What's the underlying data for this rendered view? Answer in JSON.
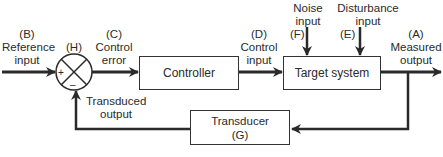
{
  "diagram": {
    "type": "feedback-control-loop",
    "blocks": {
      "controller": {
        "label": "Controller"
      },
      "target_system": {
        "label": "Target system"
      },
      "transducer": {
        "label": "Transducer",
        "tag": "(G)"
      }
    },
    "summing_junction": {
      "tag": "(H)",
      "plus": "+",
      "minus": "–"
    },
    "signals": {
      "reference_input": {
        "tag": "(B)",
        "line1": "Reference",
        "line2": "input"
      },
      "control_error": {
        "tag": "(C)",
        "line1": "Control",
        "line2": "error"
      },
      "control_input": {
        "tag": "(D)",
        "line1": "Control",
        "line2": "input"
      },
      "noise_input": {
        "tag": "(F)",
        "line1": "Noise",
        "line2": "input"
      },
      "disturbance_input": {
        "tag": "(E)",
        "line1": "Disturbance",
        "line2": "input"
      },
      "measured_output": {
        "tag": "(A)",
        "line1": "Measured",
        "line2": "output"
      },
      "transduced_output": {
        "line1": "Transduced",
        "line2": "output"
      }
    },
    "colors": {
      "stroke": "#2a2a2a",
      "background": "#ffffff"
    }
  }
}
